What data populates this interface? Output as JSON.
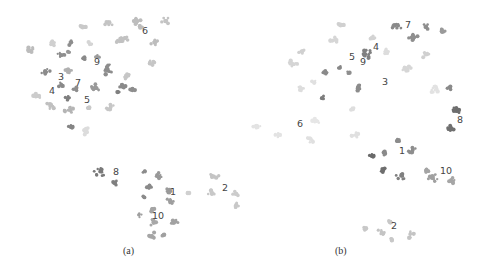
{
  "figure": {
    "panels": [
      {
        "caption": "(a)"
      },
      {
        "caption": "(b)"
      }
    ]
  },
  "chart_data": [
    {
      "type": "scatter",
      "title": "(a)",
      "xlabel": "",
      "ylabel": "",
      "grid": false,
      "legend": "none",
      "labels": [
        {
          "text": "1",
          "x": 173,
          "y": 195
        },
        {
          "text": "2",
          "x": 225,
          "y": 191
        },
        {
          "text": "3",
          "x": 61,
          "y": 80
        },
        {
          "text": "4",
          "x": 52,
          "y": 94
        },
        {
          "text": "5",
          "x": 87,
          "y": 103
        },
        {
          "text": "6",
          "x": 145,
          "y": 34
        },
        {
          "text": "7",
          "x": 78,
          "y": 86
        },
        {
          "text": "8",
          "x": 116,
          "y": 175
        },
        {
          "text": "9",
          "x": 97,
          "y": 65
        },
        {
          "text": "10",
          "x": 158,
          "y": 219
        }
      ],
      "clusters": [
        {
          "x": 82,
          "y": 26,
          "r": 4,
          "shade": "#c9c9c9"
        },
        {
          "x": 108,
          "y": 23,
          "r": 5,
          "shade": "#c4c4c4"
        },
        {
          "x": 136,
          "y": 21,
          "r": 5,
          "shade": "#bdbdbd"
        },
        {
          "x": 166,
          "y": 21,
          "r": 5,
          "shade": "#c4c4c4"
        },
        {
          "x": 140,
          "y": 27,
          "r": 3,
          "shade": "#bdbdbd"
        },
        {
          "x": 125,
          "y": 38,
          "r": 4,
          "shade": "#c2c2c2"
        },
        {
          "x": 120,
          "y": 41,
          "r": 4,
          "shade": "#c2c2c2"
        },
        {
          "x": 155,
          "y": 42,
          "r": 5,
          "shade": "#bdbdbd"
        },
        {
          "x": 29,
          "y": 50,
          "r": 5,
          "shade": "#bcbcbc"
        },
        {
          "x": 52,
          "y": 43,
          "r": 4,
          "shade": "#d0d0d0"
        },
        {
          "x": 71,
          "y": 43,
          "r": 3,
          "shade": "#8e8e8e"
        },
        {
          "x": 90,
          "y": 44,
          "r": 3,
          "shade": "#d5d5d5"
        },
        {
          "x": 61,
          "y": 55,
          "r": 4,
          "shade": "#8f8f8f"
        },
        {
          "x": 69,
          "y": 52,
          "r": 2,
          "shade": "#999999"
        },
        {
          "x": 85,
          "y": 58,
          "r": 3,
          "shade": "#8a8a8a"
        },
        {
          "x": 97,
          "y": 57,
          "r": 3,
          "shade": "#9c9c9c"
        },
        {
          "x": 151,
          "y": 63,
          "r": 4,
          "shade": "#c6c6c6"
        },
        {
          "x": 45,
          "y": 71,
          "r": 5,
          "shade": "#8b8b8b"
        },
        {
          "x": 68,
          "y": 71,
          "r": 4,
          "shade": "#b0b0b0"
        },
        {
          "x": 108,
          "y": 70,
          "r": 7,
          "shade": "#8d8d8d"
        },
        {
          "x": 127,
          "y": 77,
          "r": 4,
          "shade": "#c6c6c6"
        },
        {
          "x": 61,
          "y": 85,
          "r": 3,
          "shade": "#8a8a8a"
        },
        {
          "x": 75,
          "y": 89,
          "r": 3,
          "shade": "#8e8e8e"
        },
        {
          "x": 95,
          "y": 88,
          "r": 6,
          "shade": "#999999"
        },
        {
          "x": 123,
          "y": 87,
          "r": 4,
          "shade": "#8a8a8a"
        },
        {
          "x": 133,
          "y": 89,
          "r": 3,
          "shade": "#8e8e8e"
        },
        {
          "x": 118,
          "y": 92,
          "r": 2,
          "shade": "#7f7f7f"
        },
        {
          "x": 68,
          "y": 98,
          "r": 4,
          "shade": "#7f7f7f"
        },
        {
          "x": 37,
          "y": 96,
          "r": 4,
          "shade": "#cccccc"
        },
        {
          "x": 50,
          "y": 106,
          "r": 5,
          "shade": "#c0c0c0"
        },
        {
          "x": 69,
          "y": 110,
          "r": 5,
          "shade": "#b5b5b5"
        },
        {
          "x": 88,
          "y": 108,
          "r": 3,
          "shade": "#c9c9c9"
        },
        {
          "x": 110,
          "y": 107,
          "r": 4,
          "shade": "#c7c7c7"
        },
        {
          "x": 71,
          "y": 127,
          "r": 3,
          "shade": "#858585"
        },
        {
          "x": 85,
          "y": 131,
          "r": 5,
          "shade": "#dcdcdc"
        },
        {
          "x": 100,
          "y": 172,
          "r": 6,
          "shade": "#7a7a7a"
        },
        {
          "x": 115,
          "y": 183,
          "r": 3,
          "shade": "#7f7f7f"
        },
        {
          "x": 145,
          "y": 172,
          "r": 2,
          "shade": "#8d8d8d"
        },
        {
          "x": 158,
          "y": 176,
          "r": 4,
          "shade": "#999999"
        },
        {
          "x": 149,
          "y": 187,
          "r": 3,
          "shade": "#8a8a8a"
        },
        {
          "x": 167,
          "y": 191,
          "r": 4,
          "shade": "#9a9a9a"
        },
        {
          "x": 170,
          "y": 201,
          "r": 4,
          "shade": "#9e9e9e"
        },
        {
          "x": 144,
          "y": 197,
          "r": 2,
          "shade": "#8a8a8a"
        },
        {
          "x": 152,
          "y": 209,
          "r": 3,
          "shade": "#a4a4a4"
        },
        {
          "x": 139,
          "y": 215,
          "r": 3,
          "shade": "#a0a0a0"
        },
        {
          "x": 154,
          "y": 222,
          "r": 5,
          "shade": "#a8a8a8"
        },
        {
          "x": 174,
          "y": 222,
          "r": 4,
          "shade": "#a2a2a2"
        },
        {
          "x": 152,
          "y": 236,
          "r": 5,
          "shade": "#a6a6a6"
        },
        {
          "x": 164,
          "y": 235,
          "r": 2,
          "shade": "#a0a0a0"
        },
        {
          "x": 214,
          "y": 176,
          "r": 5,
          "shade": "#c4c4c4"
        },
        {
          "x": 212,
          "y": 193,
          "r": 4,
          "shade": "#c8c8c8"
        },
        {
          "x": 236,
          "y": 194,
          "r": 4,
          "shade": "#cccccc"
        },
        {
          "x": 236,
          "y": 206,
          "r": 4,
          "shade": "#c8c8c8"
        },
        {
          "x": 189,
          "y": 193,
          "r": 2,
          "shade": "#d0d0d0"
        }
      ]
    },
    {
      "type": "scatter",
      "title": "(b)",
      "xlabel": "",
      "ylabel": "",
      "grid": false,
      "legend": "none",
      "labels": [
        {
          "text": "1",
          "x": 402,
          "y": 154
        },
        {
          "text": "2",
          "x": 394,
          "y": 229
        },
        {
          "text": "3",
          "x": 385,
          "y": 85
        },
        {
          "text": "4",
          "x": 376,
          "y": 50
        },
        {
          "text": "5",
          "x": 352,
          "y": 60
        },
        {
          "text": "6",
          "x": 300,
          "y": 127
        },
        {
          "text": "7",
          "x": 408,
          "y": 28
        },
        {
          "text": "8",
          "x": 460,
          "y": 123
        },
        {
          "text": "9",
          "x": 363,
          "y": 65
        },
        {
          "text": "10",
          "x": 446,
          "y": 174
        }
      ],
      "clusters": [
        {
          "x": 340,
          "y": 24,
          "r": 4,
          "shade": "#d0d0d0"
        },
        {
          "x": 396,
          "y": 26,
          "r": 6,
          "shade": "#8a8a8a"
        },
        {
          "x": 413,
          "y": 37,
          "r": 5,
          "shade": "#8f8f8f"
        },
        {
          "x": 426,
          "y": 27,
          "r": 4,
          "shade": "#8e8e8e"
        },
        {
          "x": 442,
          "y": 31,
          "r": 4,
          "shade": "#9a9a9a"
        },
        {
          "x": 334,
          "y": 40,
          "r": 4,
          "shade": "#d6d6d6"
        },
        {
          "x": 373,
          "y": 38,
          "r": 3,
          "shade": "#d3d3d3"
        },
        {
          "x": 302,
          "y": 51,
          "r": 4,
          "shade": "#d0d0d0"
        },
        {
          "x": 365,
          "y": 54,
          "r": 7,
          "shade": "#808080"
        },
        {
          "x": 386,
          "y": 52,
          "r": 4,
          "shade": "#dddddd"
        },
        {
          "x": 426,
          "y": 54,
          "r": 5,
          "shade": "#d0d0d0"
        },
        {
          "x": 293,
          "y": 64,
          "r": 5,
          "shade": "#d5d5d5"
        },
        {
          "x": 326,
          "y": 72,
          "r": 4,
          "shade": "#8a8a8a"
        },
        {
          "x": 340,
          "y": 68,
          "r": 3,
          "shade": "#888888"
        },
        {
          "x": 348,
          "y": 73,
          "r": 2,
          "shade": "#8e8e8e"
        },
        {
          "x": 406,
          "y": 68,
          "r": 5,
          "shade": "#d6d6d6"
        },
        {
          "x": 314,
          "y": 82,
          "r": 3,
          "shade": "#e0e0e0"
        },
        {
          "x": 300,
          "y": 89,
          "r": 4,
          "shade": "#dddddd"
        },
        {
          "x": 359,
          "y": 88,
          "r": 4,
          "shade": "#8c8c8c"
        },
        {
          "x": 322,
          "y": 98,
          "r": 3,
          "shade": "#7c7c7c"
        },
        {
          "x": 435,
          "y": 90,
          "r": 5,
          "shade": "#e2e2e2"
        },
        {
          "x": 449,
          "y": 88,
          "r": 3,
          "shade": "#8a8a8a"
        },
        {
          "x": 352,
          "y": 109,
          "r": 4,
          "shade": "#dedede"
        },
        {
          "x": 456,
          "y": 111,
          "r": 5,
          "shade": "#6e6e6e"
        },
        {
          "x": 451,
          "y": 128,
          "r": 4,
          "shade": "#707070"
        },
        {
          "x": 257,
          "y": 126,
          "r": 4,
          "shade": "#e3e3e3"
        },
        {
          "x": 278,
          "y": 135,
          "r": 4,
          "shade": "#e3e3e3"
        },
        {
          "x": 316,
          "y": 121,
          "r": 4,
          "shade": "#e6e6e6"
        },
        {
          "x": 310,
          "y": 140,
          "r": 4,
          "shade": "#e0e0e0"
        },
        {
          "x": 355,
          "y": 135,
          "r": 4,
          "shade": "#e0e0e0"
        },
        {
          "x": 397,
          "y": 141,
          "r": 4,
          "shade": "#8c8c8c"
        },
        {
          "x": 412,
          "y": 150,
          "r": 4,
          "shade": "#8e8e8e"
        },
        {
          "x": 372,
          "y": 156,
          "r": 3,
          "shade": "#6a6a6a"
        },
        {
          "x": 384,
          "y": 153,
          "r": 3,
          "shade": "#8a8a8a"
        },
        {
          "x": 383,
          "y": 170,
          "r": 3,
          "shade": "#6e6e6e"
        },
        {
          "x": 401,
          "y": 176,
          "r": 5,
          "shade": "#808080"
        },
        {
          "x": 433,
          "y": 178,
          "r": 5,
          "shade": "#a0a0a0"
        },
        {
          "x": 452,
          "y": 181,
          "r": 4,
          "shade": "#a6a6a6"
        },
        {
          "x": 426,
          "y": 171,
          "r": 3,
          "shade": "#a4a4a4"
        },
        {
          "x": 364,
          "y": 229,
          "r": 3,
          "shade": "#c8c8c8"
        },
        {
          "x": 381,
          "y": 232,
          "r": 4,
          "shade": "#c4c4c4"
        },
        {
          "x": 390,
          "y": 222,
          "r": 3,
          "shade": "#c8c8c8"
        },
        {
          "x": 410,
          "y": 234,
          "r": 5,
          "shade": "#c4c4c4"
        },
        {
          "x": 392,
          "y": 240,
          "r": 3,
          "shade": "#c8c8c8"
        }
      ]
    }
  ]
}
